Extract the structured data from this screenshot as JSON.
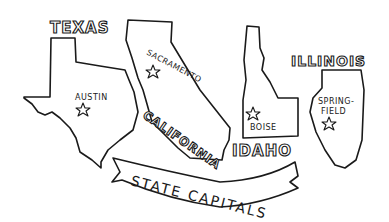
{
  "illustration": {
    "banner": "STATE CAPITALS",
    "states": [
      {
        "name": "TEXAS",
        "capital": "AUSTIN"
      },
      {
        "name": "CALIFORNIA",
        "capital": "SACRAMENTO"
      },
      {
        "name": "IDAHO",
        "capital": "BOISE"
      },
      {
        "name": "ILLINOIS",
        "capital_line1": "SPRING-",
        "capital_line2": "FIELD"
      }
    ]
  }
}
